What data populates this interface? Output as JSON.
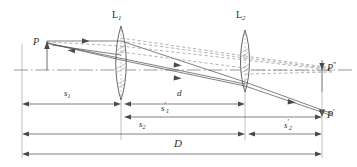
{
  "figure": {
    "kind": "optics-ray-diagram",
    "colors": {
      "ray_solid": "#4a4a4a",
      "ray_dashed": "#8a8a8a",
      "axis": "#6e6e6e",
      "lens_outline": "#555555",
      "lens_hatch": "#9a9a9a",
      "dimension": "#4a4a4a",
      "text": "#2b2b2b",
      "background": "#ffffff"
    },
    "lenses": [
      {
        "id": "L1",
        "label": "L",
        "subscript": "1",
        "x": 121
      },
      {
        "id": "L2",
        "label": "L",
        "subscript": "2",
        "x": 245
      }
    ],
    "points": [
      {
        "id": "P",
        "label": "P",
        "prime": "",
        "x": 38,
        "y": 44
      },
      {
        "id": "Ppp",
        "label": "P",
        "prime": "″",
        "x": 334,
        "y": 70
      },
      {
        "id": "Pp",
        "label": "P",
        "prime": "′",
        "x": 334,
        "y": 117
      }
    ],
    "dimensions": [
      {
        "id": "s1",
        "label": "s",
        "subscript": "1",
        "prime": "",
        "from_x": 22,
        "to_x": 121,
        "y": 104,
        "label_x": 68,
        "label_y": 93
      },
      {
        "id": "d",
        "label": "d",
        "subscript": "",
        "prime": "",
        "from_x": 124,
        "to_x": 245,
        "y": 104,
        "label_x": 180,
        "label_y": 93
      },
      {
        "id": "s1p",
        "label": "s",
        "subscript": "1",
        "prime": "′",
        "from_x": 124,
        "to_x": 334,
        "y": 117,
        "label_x": 165,
        "label_y": 106
      },
      {
        "id": "s2",
        "label": "s",
        "subscript": "2",
        "prime": "",
        "from_x": 22,
        "to_x": 245,
        "y": 134,
        "label_x": 143,
        "label_y": 123
      },
      {
        "id": "s2p",
        "label": "s",
        "subscript": "2",
        "prime": "′",
        "from_x": 248,
        "to_x": 334,
        "y": 134,
        "label_x": 288,
        "label_y": 123
      },
      {
        "id": "D",
        "label": "D",
        "subscript": "",
        "prime": "",
        "from_x": 22,
        "to_x": 334,
        "y": 154,
        "label_x": 178,
        "label_y": 141
      }
    ]
  }
}
